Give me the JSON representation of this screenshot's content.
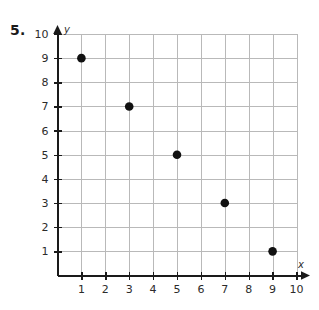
{
  "problem": {
    "number_label": "5."
  },
  "chart_data": {
    "type": "scatter",
    "title": "",
    "xlabel": "x",
    "ylabel": "y",
    "xlim": [
      0,
      10
    ],
    "ylim": [
      0,
      10
    ],
    "grid": true,
    "legend": "none",
    "x_ticks": [
      1,
      2,
      3,
      4,
      5,
      6,
      7,
      8,
      9,
      10
    ],
    "x_tick_labels": [
      "1",
      "2",
      "3",
      "4",
      "5",
      "6",
      "7",
      "8",
      "9",
      "10"
    ],
    "y_ticks": [
      1,
      2,
      3,
      4,
      5,
      6,
      7,
      8,
      9,
      10
    ],
    "y_tick_labels": [
      "1",
      "2",
      "3",
      "4",
      "5",
      "6",
      "7",
      "8",
      "9",
      "10"
    ],
    "series": [
      {
        "name": "points",
        "marker": "filled-circle",
        "color": "#111111",
        "points": [
          {
            "x": 1,
            "y": 9
          },
          {
            "x": 3,
            "y": 7
          },
          {
            "x": 5,
            "y": 5
          },
          {
            "x": 7,
            "y": 3
          },
          {
            "x": 9,
            "y": 1
          }
        ]
      }
    ]
  },
  "colors": {
    "gridline": "#b9b9b9",
    "axis": "#1a1a1a",
    "point": "#111111",
    "background": "#ffffff"
  }
}
